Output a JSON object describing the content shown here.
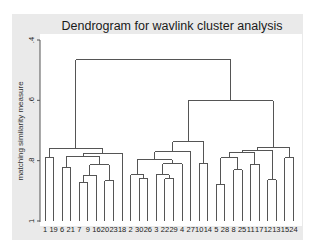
{
  "chart_data": {
    "type": "dendrogram",
    "title": "Dendrogram for wavlink cluster analysis",
    "xlabel": "",
    "ylabel": "matching similarity measure",
    "ylim": [
      0.4,
      1.0
    ],
    "y_inverted": true,
    "yticks": [
      0.4,
      0.6,
      0.8,
      1.0
    ],
    "ytick_labels": [
      ".4",
      ".6",
      ".8",
      "1"
    ],
    "leaves": [
      "1",
      "19",
      "6",
      "21",
      "7",
      "9",
      "16",
      "20",
      "23",
      "18",
      "2",
      "30",
      "26",
      "3",
      "22",
      "29",
      "4",
      "27",
      "10",
      "14",
      "5",
      "28",
      "8",
      "25",
      "11",
      "17",
      "12",
      "13",
      "15",
      "24"
    ],
    "tree": {
      "h": 0.466,
      "children": [
        {
          "h": 0.761,
          "children": [
            {
              "h": 0.791,
              "children": [
                "1",
                "19"
              ]
            },
            {
              "h": 0.775,
              "children": [
                {
                  "h": 0.785,
                  "children": [
                    {
                      "h": 0.824,
                      "children": [
                        "6",
                        "21"
                      ]
                    },
                    {
                      "h": 0.814,
                      "children": [
                        {
                          "h": 0.848,
                          "children": [
                            {
                              "h": 0.874,
                              "children": [
                                "7",
                                "9"
                              ]
                            },
                            "16"
                          ]
                        },
                        {
                          "h": 0.867,
                          "children": [
                            "20",
                            "23"
                          ]
                        }
                      ]
                    }
                  ]
                },
                "18"
              ]
            }
          ]
        },
        {
          "h": 0.602,
          "children": [
            {
              "h": 0.738,
              "children": [
                {
                  "h": 0.77,
                  "children": [
                    {
                      "h": 0.797,
                      "children": [
                        {
                          "h": 0.847,
                          "children": [
                            "2",
                            {
                              "h": 0.86,
                              "children": [
                                "30",
                                "26"
                              ]
                            }
                          ]
                        },
                        {
                          "h": 0.81,
                          "children": [
                            {
                              "h": 0.847,
                              "children": [
                                "3",
                                {
                                  "h": 0.86,
                                  "children": [
                                    "22",
                                    "29"
                                  ]
                                }
                              ]
                            },
                            "4"
                          ]
                        }
                      ]
                    },
                    "27"
                  ]
                },
                {
                  "h": 0.808,
                  "children": [
                    "10",
                    "14"
                  ]
                }
              ]
            },
            {
              "h": 0.755,
              "children": [
                {
                  "h": 0.765,
                  "children": [
                    {
                      "h": 0.774,
                      "children": [
                        {
                          "h": 0.79,
                          "children": [
                            {
                              "h": 0.88,
                              "children": [
                                "5",
                                "28"
                              ]
                            },
                            {
                              "h": 0.83,
                              "children": [
                                "8",
                                "25"
                              ]
                            }
                          ]
                        },
                        {
                          "h": 0.812,
                          "children": [
                            "11",
                            "17"
                          ]
                        }
                      ]
                    },
                    {
                      "h": 0.864,
                      "children": [
                        "12",
                        "13"
                      ]
                    }
                  ]
                },
                {
                  "h": 0.79,
                  "children": [
                    "15",
                    "24"
                  ]
                }
              ]
            }
          ]
        }
      ]
    }
  }
}
